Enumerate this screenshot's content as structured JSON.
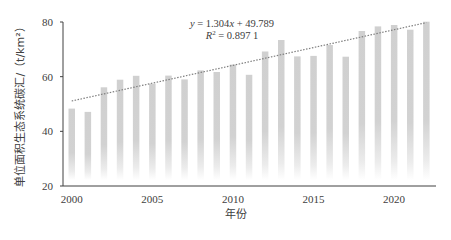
{
  "chart_data": {
    "type": "bar",
    "title": "",
    "xlabel": "年份",
    "ylabel": "单位面积生态系统碳汇/（t/km²）",
    "ylim": [
      20,
      80
    ],
    "yticks": [
      20,
      40,
      60,
      80
    ],
    "xticks": [
      2000,
      2005,
      2010,
      2015,
      2020
    ],
    "categories": [
      2000,
      2001,
      2002,
      2003,
      2004,
      2005,
      2006,
      2007,
      2008,
      2009,
      2010,
      2011,
      2012,
      2013,
      2014,
      2015,
      2016,
      2017,
      2018,
      2019,
      2020,
      2021,
      2022
    ],
    "values": [
      48.3,
      47.1,
      56.1,
      58.9,
      60.3,
      57.4,
      60.4,
      59.0,
      62.3,
      61.7,
      64.4,
      60.7,
      69.2,
      73.4,
      67.4,
      67.6,
      71.6,
      67.3,
      76.7,
      78.4,
      78.9,
      77.2,
      80.1
    ],
    "trendline": {
      "type": "linear",
      "slope": 1.304,
      "intercept": 49.789,
      "r2": 0.8971,
      "style": "dotted"
    },
    "annotations": [
      "y = 1.304x + 49.789",
      "R² = 0.897 1"
    ],
    "grid": false,
    "legend": null,
    "colors": {
      "bar": "#d0d0d0",
      "trend": "#7f7f7f",
      "axis": "#404040"
    }
  },
  "labels": {
    "equation_line1": "y = 1.304x + 49.789",
    "equation_line2_prefix": "R",
    "equation_line2_suffix": " = 0.897 1",
    "xlabel": "年份",
    "ylabel": "单位面积生态系统碳汇/（t/km²）"
  }
}
